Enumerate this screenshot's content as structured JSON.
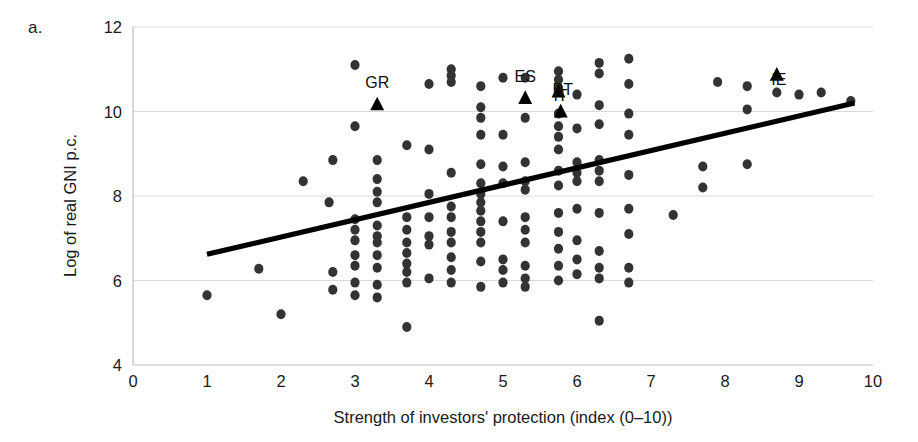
{
  "figure": {
    "panel_label": "a.",
    "background_color": "#ffffff"
  },
  "chart_data": {
    "type": "scatter",
    "title": "",
    "panel": "a.",
    "xlabel": "Strength of investors' protection (index (0–10))",
    "ylabel": "Log of real GNI p.c.",
    "xlim": [
      0,
      10
    ],
    "ylim": [
      4,
      12
    ],
    "xticks": [
      0,
      1,
      2,
      3,
      4,
      5,
      6,
      7,
      8,
      9,
      10
    ],
    "yticks": [
      4,
      6,
      8,
      10,
      12
    ],
    "grid": "horizontal",
    "legend": "none",
    "marker_color": "#333333",
    "marker_shape": "circle",
    "highlight_marker_shape": "triangle",
    "trendline": {
      "type": "linear",
      "color": "#000000",
      "x_start": 1.0,
      "y_start": 6.62,
      "x_end": 9.75,
      "y_end": 10.2,
      "slope": 0.409,
      "intercept": 6.211
    },
    "annotations": [
      {
        "label": "GR",
        "x": 3.3,
        "y": 10.15,
        "label_dx": 0,
        "label_dy": -14
      },
      {
        "label": "ES",
        "x": 5.3,
        "y": 10.3,
        "label_dx": 0,
        "label_dy": -14
      },
      {
        "label": "IT",
        "x": 5.75,
        "y": 10.45,
        "label_dx": 2,
        "label_dy": 12
      },
      {
        "label": "PT",
        "x": 5.78,
        "y": 9.98,
        "label_dx": 2,
        "label_dy": -14
      },
      {
        "label": "IE",
        "x": 8.7,
        "y": 10.85,
        "label_dx": 2,
        "label_dy": 12
      }
    ],
    "points": [
      [
        1.0,
        5.65
      ],
      [
        1.7,
        6.28
      ],
      [
        2.0,
        5.2
      ],
      [
        2.3,
        8.35
      ],
      [
        2.65,
        7.85
      ],
      [
        2.7,
        6.2
      ],
      [
        2.7,
        5.78
      ],
      [
        2.7,
        8.85
      ],
      [
        3.0,
        11.1
      ],
      [
        3.0,
        9.65
      ],
      [
        3.0,
        7.45
      ],
      [
        3.0,
        7.2
      ],
      [
        3.0,
        6.95
      ],
      [
        3.0,
        6.6
      ],
      [
        3.0,
        6.35
      ],
      [
        3.0,
        5.95
      ],
      [
        3.0,
        5.65
      ],
      [
        3.3,
        8.85
      ],
      [
        3.3,
        8.4
      ],
      [
        3.3,
        8.1
      ],
      [
        3.3,
        7.85
      ],
      [
        3.3,
        7.3
      ],
      [
        3.3,
        7.05
      ],
      [
        3.3,
        6.9
      ],
      [
        3.3,
        6.6
      ],
      [
        3.3,
        6.3
      ],
      [
        3.3,
        5.9
      ],
      [
        3.3,
        5.6
      ],
      [
        3.7,
        9.2
      ],
      [
        3.7,
        7.5
      ],
      [
        3.7,
        7.2
      ],
      [
        3.7,
        6.9
      ],
      [
        3.7,
        6.65
      ],
      [
        3.7,
        6.4
      ],
      [
        3.7,
        6.2
      ],
      [
        3.7,
        5.95
      ],
      [
        3.7,
        4.9
      ],
      [
        4.0,
        10.65
      ],
      [
        4.0,
        9.1
      ],
      [
        4.0,
        8.05
      ],
      [
        4.0,
        7.5
      ],
      [
        4.0,
        7.05
      ],
      [
        4.0,
        6.85
      ],
      [
        4.0,
        6.05
      ],
      [
        4.3,
        11.0
      ],
      [
        4.3,
        10.85
      ],
      [
        4.3,
        10.7
      ],
      [
        4.3,
        8.55
      ],
      [
        4.3,
        7.75
      ],
      [
        4.3,
        7.5
      ],
      [
        4.3,
        7.15
      ],
      [
        4.3,
        6.9
      ],
      [
        4.3,
        6.55
      ],
      [
        4.3,
        6.25
      ],
      [
        4.3,
        5.95
      ],
      [
        4.7,
        10.6
      ],
      [
        4.7,
        10.1
      ],
      [
        4.7,
        9.85
      ],
      [
        4.7,
        9.45
      ],
      [
        4.7,
        8.75
      ],
      [
        4.7,
        8.3
      ],
      [
        4.7,
        8.05
      ],
      [
        4.7,
        7.85
      ],
      [
        4.7,
        7.65
      ],
      [
        4.7,
        7.4
      ],
      [
        4.7,
        7.15
      ],
      [
        4.7,
        6.9
      ],
      [
        4.7,
        6.45
      ],
      [
        4.7,
        5.85
      ],
      [
        5.0,
        10.8
      ],
      [
        5.0,
        9.45
      ],
      [
        5.0,
        8.7
      ],
      [
        5.0,
        8.3
      ],
      [
        5.0,
        7.4
      ],
      [
        5.0,
        6.5
      ],
      [
        5.0,
        6.25
      ],
      [
        5.0,
        5.95
      ],
      [
        5.3,
        10.8
      ],
      [
        5.3,
        9.85
      ],
      [
        5.3,
        8.8
      ],
      [
        5.3,
        8.35
      ],
      [
        5.3,
        8.15
      ],
      [
        5.3,
        7.5
      ],
      [
        5.3,
        7.2
      ],
      [
        5.3,
        6.9
      ],
      [
        5.3,
        6.35
      ],
      [
        5.3,
        6.05
      ],
      [
        5.3,
        5.85
      ],
      [
        5.75,
        10.95
      ],
      [
        5.75,
        10.75
      ],
      [
        5.75,
        10.55
      ],
      [
        5.75,
        9.95
      ],
      [
        5.75,
        9.65
      ],
      [
        5.75,
        9.4
      ],
      [
        5.75,
        9.1
      ],
      [
        5.75,
        8.6
      ],
      [
        5.75,
        8.25
      ],
      [
        5.75,
        7.6
      ],
      [
        5.75,
        7.15
      ],
      [
        5.75,
        6.75
      ],
      [
        5.75,
        6.35
      ],
      [
        5.75,
        6.0
      ],
      [
        6.0,
        10.4
      ],
      [
        6.0,
        9.6
      ],
      [
        6.0,
        8.8
      ],
      [
        6.0,
        8.55
      ],
      [
        6.0,
        8.35
      ],
      [
        6.0,
        7.7
      ],
      [
        6.0,
        6.95
      ],
      [
        6.0,
        6.5
      ],
      [
        6.0,
        6.15
      ],
      [
        6.3,
        11.15
      ],
      [
        6.3,
        10.9
      ],
      [
        6.3,
        10.15
      ],
      [
        6.3,
        9.7
      ],
      [
        6.3,
        8.85
      ],
      [
        6.3,
        8.6
      ],
      [
        6.3,
        8.35
      ],
      [
        6.3,
        7.6
      ],
      [
        6.3,
        6.7
      ],
      [
        6.3,
        6.3
      ],
      [
        6.3,
        6.05
      ],
      [
        6.3,
        5.05
      ],
      [
        6.7,
        11.25
      ],
      [
        6.7,
        10.65
      ],
      [
        6.7,
        9.95
      ],
      [
        6.7,
        9.45
      ],
      [
        6.7,
        8.5
      ],
      [
        6.7,
        7.7
      ],
      [
        6.7,
        7.1
      ],
      [
        6.7,
        6.3
      ],
      [
        6.7,
        5.95
      ],
      [
        7.3,
        7.55
      ],
      [
        7.7,
        8.7
      ],
      [
        7.7,
        8.2
      ],
      [
        7.9,
        10.7
      ],
      [
        8.3,
        10.6
      ],
      [
        8.3,
        10.05
      ],
      [
        8.3,
        8.75
      ],
      [
        8.7,
        10.45
      ],
      [
        9.0,
        10.4
      ],
      [
        9.3,
        10.45
      ],
      [
        9.7,
        10.25
      ]
    ]
  },
  "axes": {
    "y_tick_labels": [
      "12",
      "10",
      "8",
      "6",
      "4"
    ],
    "x_tick_labels": [
      "0",
      "1",
      "2",
      "3",
      "4",
      "5",
      "6",
      "7",
      "8",
      "9",
      "10"
    ],
    "y_title": "Log of real GNI p.c.",
    "x_title": "Strength of investors' protection (index (0–10))"
  }
}
